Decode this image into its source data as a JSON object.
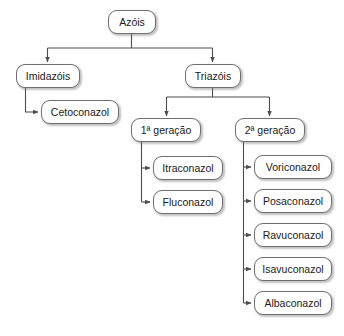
{
  "diagram": {
    "type": "hierarchy-tree",
    "orientation": "top-down-with-side-branches",
    "colors": {
      "background": "#ffffff",
      "node_fill": "#ffffff",
      "node_border": "#6f6f6f",
      "edge": "#4d4d4d",
      "text": "#1a1a1a"
    },
    "nodes": [
      {
        "id": "azois",
        "label": "Azóis",
        "level": 0,
        "x": 108,
        "y": 10,
        "w": 48,
        "h": 24
      },
      {
        "id": "imidazois",
        "label": "Imidazóis",
        "level": 1,
        "x": 16,
        "y": 64,
        "w": 64,
        "h": 24
      },
      {
        "id": "triazois",
        "label": "Triazóis",
        "level": 1,
        "x": 185,
        "y": 64,
        "w": 56,
        "h": 24
      },
      {
        "id": "cetoconazol",
        "label": "Cetoconazol",
        "level": 2,
        "x": 41,
        "y": 100,
        "w": 78,
        "h": 24
      },
      {
        "id": "geracao1",
        "label": "1ª geração",
        "level": 2,
        "x": 131,
        "y": 118,
        "w": 70,
        "h": 24
      },
      {
        "id": "geracao2",
        "label": "2ª geração",
        "level": 2,
        "x": 235,
        "y": 118,
        "w": 70,
        "h": 24
      },
      {
        "id": "itraconazol",
        "label": "Itraconazol",
        "level": 3,
        "x": 153,
        "y": 156,
        "w": 70,
        "h": 24
      },
      {
        "id": "fluconazol",
        "label": "Fluconazol",
        "level": 3,
        "x": 153,
        "y": 190,
        "w": 70,
        "h": 24
      },
      {
        "id": "voriconazol",
        "label": "Voriconazol",
        "level": 3,
        "x": 254,
        "y": 155,
        "w": 78,
        "h": 24
      },
      {
        "id": "posaconazol",
        "label": "Posaconazol",
        "level": 3,
        "x": 254,
        "y": 189,
        "w": 78,
        "h": 24
      },
      {
        "id": "ravuconazol",
        "label": "Ravuconazol",
        "level": 3,
        "x": 254,
        "y": 223,
        "w": 78,
        "h": 24
      },
      {
        "id": "isavuconazol",
        "label": "Isavuconazol",
        "level": 3,
        "x": 254,
        "y": 257,
        "w": 78,
        "h": 24
      },
      {
        "id": "albaconazol",
        "label": "Albaconazol",
        "level": 3,
        "x": 254,
        "y": 291,
        "w": 78,
        "h": 24
      }
    ],
    "edges": [
      {
        "from": "azois",
        "to": "imidazois",
        "style": "elbow-down"
      },
      {
        "from": "azois",
        "to": "triazois",
        "style": "elbow-down"
      },
      {
        "from": "imidazois",
        "to": "cetoconazol",
        "style": "elbow-right"
      },
      {
        "from": "triazois",
        "to": "geracao1",
        "style": "elbow-down"
      },
      {
        "from": "triazois",
        "to": "geracao2",
        "style": "elbow-down"
      },
      {
        "from": "geracao1",
        "to": "itraconazol",
        "style": "elbow-right"
      },
      {
        "from": "geracao1",
        "to": "fluconazol",
        "style": "elbow-right"
      },
      {
        "from": "geracao2",
        "to": "voriconazol",
        "style": "elbow-right"
      },
      {
        "from": "geracao2",
        "to": "posaconazol",
        "style": "elbow-right"
      },
      {
        "from": "geracao2",
        "to": "ravuconazol",
        "style": "elbow-right"
      },
      {
        "from": "geracao2",
        "to": "isavuconazol",
        "style": "elbow-right"
      },
      {
        "from": "geracao2",
        "to": "albaconazol",
        "style": "elbow-right"
      }
    ]
  }
}
